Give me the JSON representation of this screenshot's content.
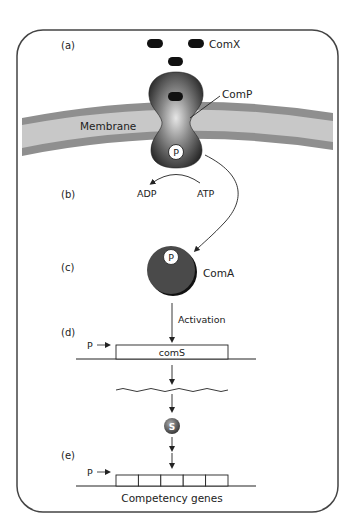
{
  "panels": {
    "a": "(a)",
    "b": "(b)",
    "c": "(c)",
    "d": "(d)",
    "e": "(e)"
  },
  "labels": {
    "comx": "ComX",
    "comp": "ComP",
    "membrane": "Membrane",
    "adp": "ADP",
    "atp": "ATP",
    "coma": "ComA",
    "phosphate": "P",
    "activation": "Activation",
    "promoter_d": "P",
    "coms_gene": "comS",
    "coms_protein": "S",
    "promoter_e": "P",
    "competency_genes": "Competency genes"
  },
  "colors": {
    "frame": "#444444",
    "membrane_outer": "#8f8f8f",
    "membrane_inner": "#c8c8c8",
    "protein_dark": "#2e2e2e",
    "protein_light": "#d8d8d8",
    "coma_fill": "#4a4a4a",
    "ligand": "#111111"
  },
  "competency_gene_boxes": 5
}
